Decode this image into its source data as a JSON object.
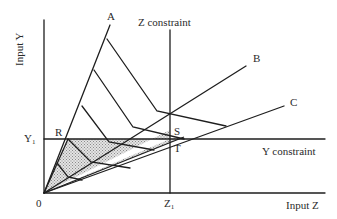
{
  "axes": {
    "y_label": "Input Y",
    "x_label": "Input Z",
    "origin_label": "0"
  },
  "constraints": {
    "z_constraint_label": "Z constraint",
    "y_constraint_label": "Y constraint",
    "z1_label": "Z",
    "z1_sub": "1",
    "y1_label": "Y",
    "y1_sub": "1"
  },
  "rays": [
    {
      "label": "A"
    },
    {
      "label": "B"
    },
    {
      "label": "C"
    }
  ],
  "points": {
    "R": "R",
    "S": "S",
    "T": "T"
  },
  "colors": {
    "line": "#1e1e1e",
    "shade": "#c8c8c8",
    "background": "#ffffff"
  }
}
